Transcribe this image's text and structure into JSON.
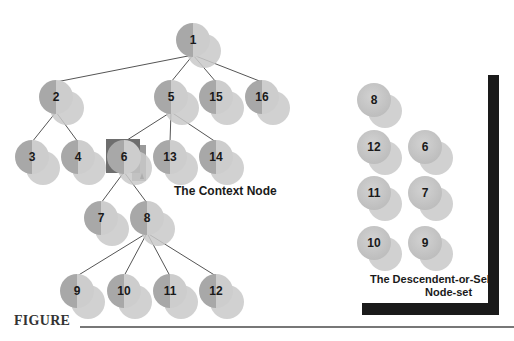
{
  "colors": {
    "node_front": "#a9a9a9",
    "node_light": "#cfcfcf",
    "node_back": "#cacaca",
    "edge": "#555555",
    "highlight": "#6e6e6e",
    "frame": "#1a1a1a"
  },
  "tree": {
    "nodes": [
      {
        "id": "1",
        "x": 193,
        "y": 40
      },
      {
        "id": "2",
        "x": 56,
        "y": 97
      },
      {
        "id": "5",
        "x": 171,
        "y": 97
      },
      {
        "id": "15",
        "x": 216,
        "y": 97
      },
      {
        "id": "16",
        "x": 262,
        "y": 97
      },
      {
        "id": "3",
        "x": 32,
        "y": 157
      },
      {
        "id": "4",
        "x": 78,
        "y": 157
      },
      {
        "id": "6",
        "x": 124,
        "y": 157,
        "context": true
      },
      {
        "id": "13",
        "x": 170,
        "y": 157
      },
      {
        "id": "14",
        "x": 216,
        "y": 157
      },
      {
        "id": "7",
        "x": 101,
        "y": 218
      },
      {
        "id": "8",
        "x": 147,
        "y": 218
      },
      {
        "id": "9",
        "x": 77,
        "y": 291
      },
      {
        "id": "10",
        "x": 124,
        "y": 291
      },
      {
        "id": "11",
        "x": 170,
        "y": 291
      },
      {
        "id": "12",
        "x": 216,
        "y": 291
      }
    ],
    "edges": [
      [
        "1",
        "2"
      ],
      [
        "1",
        "5"
      ],
      [
        "1",
        "15"
      ],
      [
        "1",
        "16"
      ],
      [
        "2",
        "3"
      ],
      [
        "2",
        "4"
      ],
      [
        "5",
        "6"
      ],
      [
        "5",
        "13"
      ],
      [
        "5",
        "14"
      ],
      [
        "6",
        "7"
      ],
      [
        "6",
        "8"
      ],
      [
        "8",
        "9"
      ],
      [
        "8",
        "10"
      ],
      [
        "8",
        "11"
      ],
      [
        "8",
        "12"
      ]
    ]
  },
  "nodeset": {
    "nodes": [
      {
        "id": "8",
        "x": 374,
        "y": 100
      },
      {
        "id": "12",
        "x": 374,
        "y": 147
      },
      {
        "id": "6",
        "x": 425,
        "y": 147
      },
      {
        "id": "11",
        "x": 374,
        "y": 193
      },
      {
        "id": "7",
        "x": 425,
        "y": 193
      },
      {
        "id": "10",
        "x": 374,
        "y": 243
      },
      {
        "id": "9",
        "x": 425,
        "y": 243
      }
    ]
  },
  "labels": {
    "context_node": "The Context Node",
    "nodeset_line1": "The Descendent-or-Self",
    "nodeset_line2": "Node-set",
    "figure": "FIGURE"
  }
}
